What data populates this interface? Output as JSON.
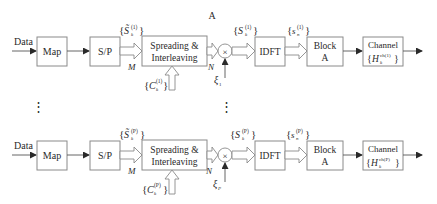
{
  "title_label": "A",
  "rows": [
    {
      "id": "1",
      "input_label": "Data",
      "blocks": {
        "map": "Map",
        "sp": "S/P",
        "spreading_line1": "Spreading &",
        "spreading_line2": "Interleaving",
        "mult": "×",
        "idft": "IDFT",
        "block_line1": "Block",
        "block_line2": "A",
        "channel_line1": "Channel"
      },
      "signals": {
        "s_tilde": "S̃",
        "s_tilde_sup": "(1)",
        "s_tilde_sub": "k",
        "m_label": "M",
        "c": "C",
        "c_sup": "(1)",
        "c_sub": "k",
        "n_label": "N",
        "xi": "ξ",
        "xi_sub": "1",
        "s": "S",
        "s_sup": "(1)",
        "s_sub": "k",
        "sn": "s",
        "sn_sup": "(1)",
        "sn_sub": "n",
        "h": "H",
        "h_sup": "ch(1)",
        "h_sub": "k"
      }
    },
    {
      "id": "P",
      "input_label": "Data",
      "blocks": {
        "map": "Map",
        "sp": "S/P",
        "spreading_line1": "Spreading &",
        "spreading_line2": "Interleaving",
        "mult": "×",
        "idft": "IDFT",
        "block_line1": "Block",
        "block_line2": "A",
        "channel_line1": "Channel"
      },
      "signals": {
        "s_tilde": "S̃",
        "s_tilde_sup": "(P)",
        "s_tilde_sub": "k",
        "m_label": "M",
        "c": "C",
        "c_sup": "(P)",
        "c_sub": "k",
        "n_label": "N",
        "xi": "ξ",
        "xi_sub": "P",
        "s": "S",
        "s_sup": "(P)",
        "s_sub": "k",
        "sn": "s",
        "sn_sup": "(P)",
        "sn_sub": "n",
        "h": "H",
        "h_sup": "ch(P)",
        "h_sub": "k"
      }
    }
  ],
  "ellipsis": "⋮",
  "brace_open": "{",
  "brace_close": "}"
}
